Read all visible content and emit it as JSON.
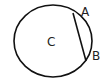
{
  "diagram": {
    "circle_label": "C",
    "point_a_label": "A",
    "point_b_label": "B",
    "stroke_color": "#111111"
  }
}
